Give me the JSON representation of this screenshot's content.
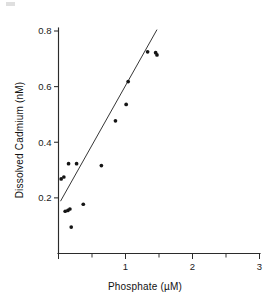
{
  "chart_data": {
    "type": "scatter",
    "title": "",
    "xlabel": "Phosphate (µM)",
    "ylabel": "Dissolved Cadmium (nM)",
    "xlim": [
      0,
      3
    ],
    "ylim": [
      0,
      0.8
    ],
    "grid": false,
    "legend": null,
    "x_ticks": [
      {
        "value": 0,
        "label": "",
        "minor": false
      },
      {
        "value": 0.5,
        "label": "",
        "minor": true
      },
      {
        "value": 1,
        "label": "1",
        "minor": false
      },
      {
        "value": 1.5,
        "label": "",
        "minor": true
      },
      {
        "value": 2,
        "label": "2",
        "minor": false
      },
      {
        "value": 2.5,
        "label": "",
        "minor": true
      },
      {
        "value": 3,
        "label": "3",
        "minor": false
      }
    ],
    "y_ticks": [
      {
        "value": 0.2,
        "label": "0.2"
      },
      {
        "value": 0.4,
        "label": "0.4"
      },
      {
        "value": 0.6,
        "label": "0.6"
      },
      {
        "value": 0.8,
        "label": "0.8"
      }
    ],
    "series": [
      {
        "name": "Dissolved cadmium vs phosphate",
        "marker": "filled-circle",
        "color": "#151515",
        "points": [
          {
            "x": 0.04,
            "y": 0.268
          },
          {
            "x": 0.08,
            "y": 0.275
          },
          {
            "x": 0.1,
            "y": 0.152
          },
          {
            "x": 0.14,
            "y": 0.155
          },
          {
            "x": 0.15,
            "y": 0.323
          },
          {
            "x": 0.17,
            "y": 0.16
          },
          {
            "x": 0.19,
            "y": 0.095
          },
          {
            "x": 0.27,
            "y": 0.323
          },
          {
            "x": 0.37,
            "y": 0.177
          },
          {
            "x": 0.64,
            "y": 0.316
          },
          {
            "x": 0.85,
            "y": 0.477
          },
          {
            "x": 1.01,
            "y": 0.536
          },
          {
            "x": 1.04,
            "y": 0.618
          },
          {
            "x": 1.33,
            "y": 0.725
          },
          {
            "x": 1.45,
            "y": 0.722
          },
          {
            "x": 1.47,
            "y": 0.714
          }
        ]
      }
    ],
    "fit_line": {
      "name": "linear regression",
      "color": "#2b2b2b",
      "x_start": 0.03,
      "y_start": 0.188,
      "x_end": 1.47,
      "y_end": 0.805
    }
  },
  "axes": {
    "x_title": "Phosphate (µM)",
    "y_title": "Dissolved Cadmium (nM)"
  }
}
